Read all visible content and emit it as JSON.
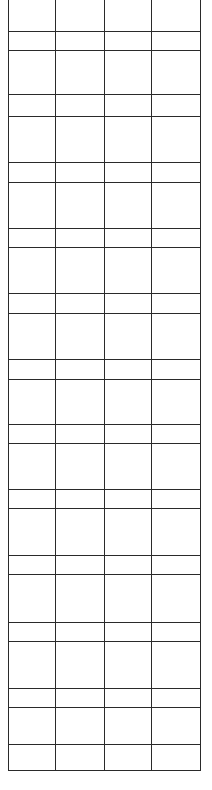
{
  "table": {
    "columns": 4,
    "left": 8,
    "right": 200,
    "top": 0,
    "bottom": 770,
    "column_lines_x": [
      8,
      55,
      104,
      151,
      200
    ],
    "row_lines_y": [
      31,
      50,
      94,
      116,
      162,
      182,
      228,
      247,
      293,
      313,
      359,
      379,
      424,
      443,
      489,
      508,
      555,
      574,
      622,
      641,
      688,
      707,
      744,
      770
    ],
    "line_color": "#2a2a2a",
    "background": "#ffffff",
    "cells_text": "all cells empty"
  }
}
